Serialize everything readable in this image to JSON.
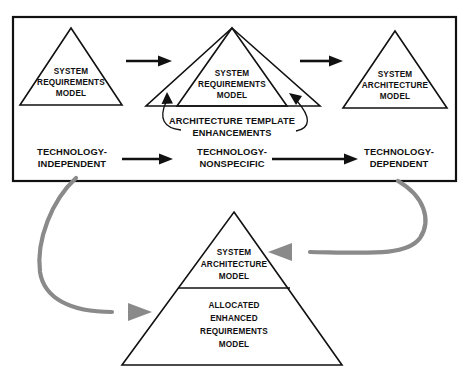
{
  "diagram": {
    "colors": {
      "stroke": "#111111",
      "feedback_arrow": "#8a8a8a",
      "background": "#ffffff"
    },
    "frame": {
      "name": "process-frame"
    },
    "top_row": {
      "pyramids": [
        {
          "id": "system-requirements-model-initial",
          "lines": [
            "SYSTEM",
            "REQUIREMENTS",
            "MODEL"
          ]
        },
        {
          "id": "system-requirements-model-enhanced",
          "lines": [
            "SYSTEM",
            "REQUIREMENTS",
            "MODEL"
          ]
        },
        {
          "id": "system-architecture-model",
          "lines": [
            "SYSTEM",
            "ARCHITECTURE",
            "MODEL"
          ]
        }
      ],
      "caption": {
        "lines": [
          "ARCHITECTURE TEMPLATE",
          "ENHANCEMENTS"
        ]
      }
    },
    "stages": [
      {
        "id": "technology-independent",
        "lines": [
          "TECHNOLOGY-",
          "INDEPENDENT"
        ]
      },
      {
        "id": "technology-nonspecific",
        "lines": [
          "TECHNOLOGY-",
          "NONSPECIFIC"
        ]
      },
      {
        "id": "technology-dependent",
        "lines": [
          "TECHNOLOGY-",
          "DEPENDENT"
        ]
      }
    ],
    "bottom_pyramid": {
      "id": "allocated-enhanced-requirements-pyramid",
      "top_section": {
        "lines": [
          "SYSTEM",
          "ARCHITECTURE",
          "MODEL"
        ]
      },
      "bottom_section": {
        "lines": [
          "ALLOCATED",
          "ENHANCED",
          "REQUIREMENTS",
          "MODEL"
        ]
      }
    },
    "feedback_arrows": [
      {
        "id": "feedback-left",
        "from": "technology-independent",
        "to": "allocated-enhanced-requirements-pyramid"
      },
      {
        "id": "feedback-right",
        "from": "technology-dependent",
        "to": "system-architecture-model-bottom"
      }
    ]
  }
}
